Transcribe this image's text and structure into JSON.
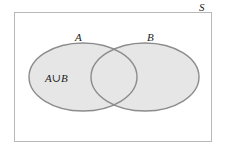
{
  "diagram": {
    "type": "venn",
    "universe": {
      "label": "S",
      "rect": {
        "x": 14.5,
        "y": 12.5,
        "width": 197,
        "height": 129
      },
      "stroke": "#b8b8b8"
    },
    "sets": [
      {
        "label": "A",
        "ellipse": {
          "cx": 83,
          "cy": 77,
          "rx": 54,
          "ry": 34
        },
        "fill": "#e6e6e6",
        "stroke": "#8c8c8c"
      },
      {
        "label": "B",
        "ellipse": {
          "cx": 145,
          "cy": 77,
          "rx": 54,
          "ry": 34
        },
        "fill": "#e6e6e6",
        "stroke": "#8c8c8c"
      }
    ],
    "shaded_region": {
      "label": "A∪B",
      "description": "union of A and B shaded"
    }
  }
}
